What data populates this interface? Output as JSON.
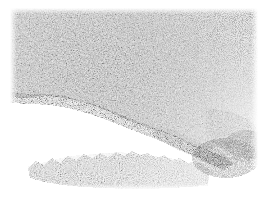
{
  "figure": {
    "kind": "photomicrograph",
    "modality": "light-microscopy",
    "rendering": "grayscale halftone scan",
    "caption": "",
    "title": "",
    "width_px": 267,
    "height_px": 199
  },
  "page": {
    "background_color": "#ffffff",
    "margins_px": {
      "top": 8,
      "right": 9,
      "bottom": 9,
      "left": 10
    }
  },
  "plate": {
    "x_px": 10,
    "y_px": 8,
    "width_px": 248,
    "height_px": 182,
    "background_color": "#ffffff"
  },
  "tone": {
    "paper_white": "#ffffff",
    "lightest_tissue": "#d8d8d8",
    "mid_tissue": "#8c8c8c",
    "dark_tissue": "#4a4a4a",
    "darkest_speckle": "#1c1c1c"
  },
  "regions": [
    {
      "name": "main-tissue-mass",
      "description": "Large dense granular mass filling the upper-left through the right side of the field.",
      "density": "dense",
      "mean_tone": "#8c8c8c",
      "extent_px": {
        "x": 10,
        "y": 8,
        "width": 248,
        "height": 150
      }
    },
    {
      "name": "upper-right-fade",
      "description": "Sparser, lighter stippling where the mass thins toward the upper-right corner.",
      "density": "sparse",
      "mean_tone": "#cfcfcf",
      "extent_px": {
        "x": 195,
        "y": 8,
        "width": 63,
        "height": 60
      }
    },
    {
      "name": "clear-void",
      "description": "Pale empty region in the lower-left, free of tissue.",
      "density": "none",
      "mean_tone": "#ffffff",
      "extent_px": {
        "x": 10,
        "y": 100,
        "width": 150,
        "height": 60
      }
    },
    {
      "name": "diagonal-boundary",
      "description": "Irregular diagonal margin of the main mass running from the left edge down toward the lower right.",
      "from_px": {
        "x": 30,
        "y": 96
      },
      "to_px": {
        "x": 182,
        "y": 150
      }
    },
    {
      "name": "lower-tissue-fragment",
      "description": "Separate detached band of tissue along the bottom border with a jagged upper contour.",
      "density": "moderate",
      "mean_tone": "#9a9a9a",
      "extent_px": {
        "x": 30,
        "y": 157,
        "width": 175,
        "height": 33
      }
    },
    {
      "name": "lower-right-speckle",
      "description": "Scattered faint speckles trailing off to white at the lower-right.",
      "density": "very sparse",
      "mean_tone": "#dddddd",
      "extent_px": {
        "x": 200,
        "y": 150,
        "width": 58,
        "height": 40
      }
    }
  ]
}
